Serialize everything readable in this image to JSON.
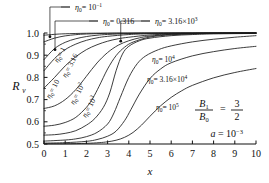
{
  "chart_data": {
    "type": "line",
    "title": "",
    "xlabel": "x",
    "ylabel": "R",
    "ylabel_sub": "v",
    "xlim": [
      0,
      10
    ],
    "ylim": [
      0.5,
      1.0
    ],
    "xticks": [
      "0",
      "1",
      "2",
      "3",
      "4",
      "5",
      "6",
      "7",
      "8",
      "9",
      "10"
    ],
    "yticks": [
      "0.5",
      "0.6",
      "0.7",
      "0.8",
      "0.9",
      "1.0"
    ],
    "grid": false,
    "legend_position": "inline-curve-labels",
    "annotations": {
      "param1_num": "B",
      "param1_num_sub": "1",
      "param1_den": "B",
      "param1_den_sub": "0",
      "param1_eq": "=",
      "param1_val_num": "3",
      "param1_val_den": "2",
      "param2": "a = 10",
      "param2_sup": "−3"
    },
    "series": [
      {
        "name": "eta0-1e-1",
        "label_eta": "η",
        "label_sub": "0",
        "label_eq": "= 10",
        "label_sup": "−1",
        "label_kind": "leader-top",
        "label_x": 75,
        "label_y": 10,
        "leader_to_x": 0.28,
        "leader_to_y": 0.983,
        "points": [
          [
            0,
            0.99
          ],
          [
            0.5,
            0.994
          ],
          [
            1,
            0.9965
          ],
          [
            2,
            0.9988
          ],
          [
            3,
            0.9995
          ],
          [
            5,
            0.9999
          ],
          [
            7,
            1.0
          ],
          [
            10,
            1.0
          ]
        ]
      },
      {
        "name": "eta0-0.316",
        "label_eta": "η",
        "label_sub": "0",
        "label_eq": "= 0.316",
        "label_sup": "",
        "label_kind": "leader-top",
        "label_x": 103,
        "label_y": 24,
        "leader_to_x": 0.52,
        "leader_to_y": 0.925,
        "points": [
          [
            0,
            0.96
          ],
          [
            0.5,
            0.977
          ],
          [
            1,
            0.987
          ],
          [
            1.5,
            0.9925
          ],
          [
            2,
            0.9955
          ],
          [
            3,
            0.9985
          ],
          [
            4,
            0.9994
          ],
          [
            6,
            0.9999
          ],
          [
            10,
            1.0
          ]
        ]
      },
      {
        "name": "eta0-1",
        "label_eta": "η",
        "label_sub": "0",
        "label_eq": "= 1",
        "label_sup": "",
        "label_kind": "diagonal",
        "label_x": 58,
        "label_y": 63,
        "label_rot": -62,
        "points": [
          [
            0,
            0.88
          ],
          [
            0.5,
            0.93
          ],
          [
            1,
            0.958
          ],
          [
            1.5,
            0.974
          ],
          [
            2,
            0.984
          ],
          [
            2.5,
            0.99
          ],
          [
            3,
            0.9935
          ],
          [
            4,
            0.9975
          ],
          [
            5,
            0.999
          ],
          [
            7,
            0.9998
          ],
          [
            10,
            1.0
          ]
        ]
      },
      {
        "name": "eta0-3.16",
        "label_eta": "η",
        "label_sub": "0",
        "label_eq": "= 3.16",
        "label_sup": "",
        "label_kind": "diagonal",
        "label_x": 66,
        "label_y": 78,
        "label_rot": -62,
        "points": [
          [
            0,
            0.83
          ],
          [
            0.5,
            0.885
          ],
          [
            1,
            0.925
          ],
          [
            1.5,
            0.95
          ],
          [
            2,
            0.967
          ],
          [
            2.5,
            0.978
          ],
          [
            3,
            0.985
          ],
          [
            4,
            0.993
          ],
          [
            5,
            0.9965
          ],
          [
            7,
            0.9992
          ],
          [
            10,
            0.9999
          ]
        ]
      },
      {
        "name": "eta0-10",
        "label_eta": "η",
        "label_sub": "0",
        "label_eq": "= 10",
        "label_sup": "",
        "label_kind": "diagonal",
        "label_x": 50,
        "label_y": 99,
        "label_rot": -62,
        "points": [
          [
            0,
            0.752
          ],
          [
            0.5,
            0.8
          ],
          [
            1,
            0.852
          ],
          [
            1.5,
            0.893
          ],
          [
            2,
            0.925
          ],
          [
            2.5,
            0.947
          ],
          [
            3,
            0.963
          ],
          [
            3.5,
            0.974
          ],
          [
            4,
            0.981
          ],
          [
            5,
            0.991
          ],
          [
            6,
            0.9955
          ],
          [
            8,
            0.999
          ],
          [
            10,
            0.9998
          ]
        ]
      },
      {
        "name": "eta0-1e2",
        "label_eta": "η",
        "label_sub": "0",
        "label_eq": "= 10",
        "label_sup": "2",
        "label_kind": "diagonal",
        "label_x": 74,
        "label_y": 105,
        "label_rot": -62,
        "points": [
          [
            0,
            0.66
          ],
          [
            0.5,
            0.672
          ],
          [
            1,
            0.7
          ],
          [
            1.5,
            0.745
          ],
          [
            2,
            0.805
          ],
          [
            2.5,
            0.865
          ],
          [
            3,
            0.912
          ],
          [
            3.5,
            0.945
          ],
          [
            4,
            0.965
          ],
          [
            4.5,
            0.978
          ],
          [
            5,
            0.986
          ],
          [
            6,
            0.9945
          ],
          [
            7,
            0.9975
          ],
          [
            8,
            0.999
          ],
          [
            10,
            0.9998
          ]
        ]
      },
      {
        "name": "eta0-1e3",
        "label_eta": "η",
        "label_sub": "0",
        "label_eq": "= 10",
        "label_sup": "3",
        "label_kind": "diagonal",
        "label_x": 86,
        "label_y": 118,
        "label_rot": -62,
        "points": [
          [
            0,
            0.58
          ],
          [
            0.5,
            0.585
          ],
          [
            1,
            0.597
          ],
          [
            1.5,
            0.62
          ],
          [
            2,
            0.665
          ],
          [
            2.3,
            0.706
          ],
          [
            2.6,
            0.76
          ],
          [
            3,
            0.838
          ],
          [
            3.4,
            0.898
          ],
          [
            3.8,
            0.936
          ],
          [
            4.2,
            0.959
          ],
          [
            5,
            0.982
          ],
          [
            6,
            0.992
          ],
          [
            7,
            0.996
          ],
          [
            8,
            0.998
          ],
          [
            10,
            0.9995
          ]
        ]
      },
      {
        "name": "eta0-3.16e3",
        "label_eta": "η",
        "label_sub": "0",
        "label_eq": "= 3.16×10",
        "label_sup": "3",
        "label_kind": "leader-top",
        "label_x": 155,
        "label_y": 24,
        "leader_to_x": 3.62,
        "leader_to_y": 0.963,
        "points": [
          [
            0,
            0.54
          ],
          [
            0.5,
            0.542
          ],
          [
            1,
            0.548
          ],
          [
            1.5,
            0.56
          ],
          [
            2,
            0.585
          ],
          [
            2.4,
            0.615
          ],
          [
            2.8,
            0.665
          ],
          [
            3.1,
            0.73
          ],
          [
            3.4,
            0.83
          ],
          [
            3.7,
            0.905
          ],
          [
            4,
            0.94
          ],
          [
            4.5,
            0.965
          ],
          [
            5,
            0.977
          ],
          [
            6,
            0.988
          ],
          [
            7,
            0.993
          ],
          [
            8,
            0.996
          ],
          [
            10,
            0.998
          ]
        ]
      },
      {
        "name": "eta0-1e4",
        "label_eta": "η",
        "label_sub": "0",
        "label_eq": "= 10",
        "label_sup": "4",
        "label_kind": "inline",
        "label_x": 152,
        "label_y": 62,
        "points": [
          [
            0,
            0.513
          ],
          [
            1,
            0.518
          ],
          [
            1.5,
            0.523
          ],
          [
            2,
            0.533
          ],
          [
            2.5,
            0.552
          ],
          [
            3,
            0.59
          ],
          [
            3.3,
            0.64
          ],
          [
            3.6,
            0.71
          ],
          [
            4,
            0.8
          ],
          [
            4.4,
            0.862
          ],
          [
            4.8,
            0.897
          ],
          [
            5.4,
            0.925
          ],
          [
            6,
            0.942
          ],
          [
            7,
            0.96
          ],
          [
            8,
            0.972
          ],
          [
            9,
            0.981
          ],
          [
            10,
            0.988
          ]
        ]
      },
      {
        "name": "eta0-3.16e4",
        "label_eta": "η",
        "label_sub": "0",
        "label_eq": "= 3.16×10",
        "label_sup": "4",
        "label_kind": "inline",
        "label_x": 147,
        "label_y": 82,
        "points": [
          [
            0,
            0.504
          ],
          [
            1,
            0.506
          ],
          [
            2,
            0.512
          ],
          [
            2.5,
            0.52
          ],
          [
            3,
            0.535
          ],
          [
            3.4,
            0.558
          ],
          [
            3.8,
            0.605
          ],
          [
            4.1,
            0.655
          ],
          [
            4.5,
            0.725
          ],
          [
            5,
            0.795
          ],
          [
            5.5,
            0.838
          ],
          [
            6,
            0.866
          ],
          [
            7,
            0.897
          ],
          [
            8,
            0.916
          ],
          [
            9,
            0.93
          ],
          [
            10,
            0.94
          ]
        ]
      },
      {
        "name": "eta0-1e5",
        "label_eta": "η",
        "label_sub": "0",
        "label_eq": "= 10",
        "label_sup": "5",
        "label_kind": "inline",
        "label_x": 156,
        "label_y": 110,
        "points": [
          [
            0,
            0.501
          ],
          [
            1,
            0.501
          ],
          [
            2,
            0.503
          ],
          [
            2.6,
            0.506
          ],
          [
            3,
            0.51
          ],
          [
            3.4,
            0.517
          ],
          [
            3.8,
            0.53
          ],
          [
            4.2,
            0.552
          ],
          [
            4.6,
            0.585
          ],
          [
            5,
            0.625
          ],
          [
            5.5,
            0.672
          ],
          [
            6,
            0.71
          ],
          [
            6.5,
            0.74
          ],
          [
            7,
            0.764
          ],
          [
            8,
            0.798
          ],
          [
            9,
            0.822
          ],
          [
            10,
            0.84
          ]
        ]
      }
    ]
  }
}
